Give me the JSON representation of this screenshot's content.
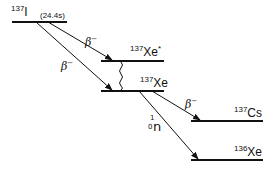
{
  "levels": {
    "i137": {
      "mass": "137",
      "element": "I",
      "half_life": "(24.4s)"
    },
    "xe137_excited": {
      "mass": "137",
      "element": "Xe",
      "suffix": "*"
    },
    "xe137": {
      "mass": "137",
      "element": "Xe"
    },
    "cs137": {
      "mass": "137",
      "element": "Cs"
    },
    "xe136": {
      "mass": "136",
      "element": "Xe"
    }
  },
  "transitions": {
    "i_to_xe_excited": {
      "symbol": "β",
      "charge": "−"
    },
    "i_to_xe": {
      "symbol": "β",
      "charge": "−"
    },
    "xe_to_cs": {
      "symbol": "β",
      "charge": "−"
    },
    "xe_to_xe136": {
      "neutron_mass": "1",
      "neutron_charge": "0",
      "neutron_symbol": "n"
    }
  }
}
